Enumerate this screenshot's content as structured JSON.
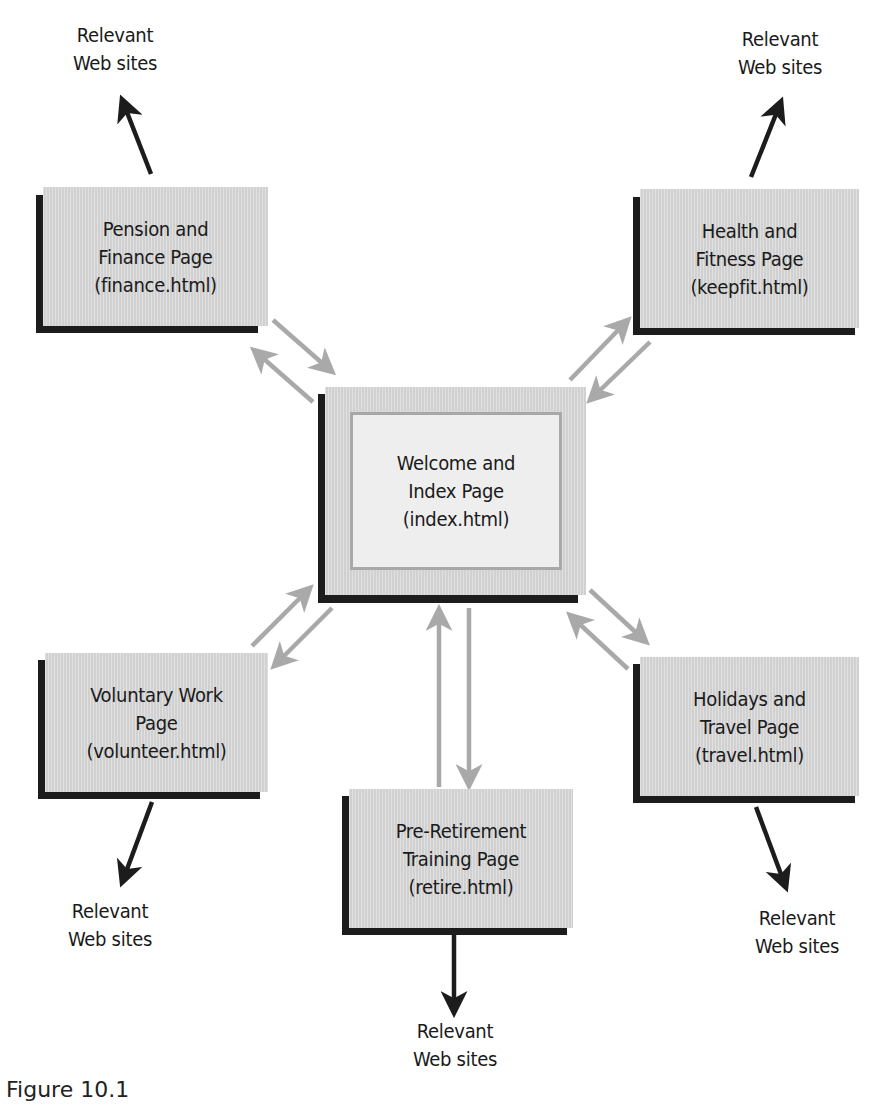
{
  "diagram": {
    "type": "site-map",
    "caption": "Figure 10.1",
    "colors": {
      "box_fill": "#d9d9d9",
      "box_shadow": "#1c1c1c",
      "hub_inner_fill": "#eeeeee",
      "hub_inner_border": "#a8a8a8",
      "internal_arrow": "#a9a9a9",
      "external_arrow": "#1c1c1c"
    },
    "hub": {
      "id": "index",
      "label": "Welcome and\nIndex Page\n(index.html)"
    },
    "pages": [
      {
        "id": "finance",
        "label": "Pension and\nFinance Page\n(finance.html)"
      },
      {
        "id": "keepfit",
        "label": "Health and\nFitness Page\n(keepfit.html)"
      },
      {
        "id": "volunteer",
        "label": "Voluntary Work\nPage\n(volunteer.html)"
      },
      {
        "id": "retire",
        "label": "Pre-Retirement\nTraining Page\n(retire.html)"
      },
      {
        "id": "travel",
        "label": "Holidays and\nTravel Page\n(travel.html)"
      }
    ],
    "external_label": "Relevant\nWeb sites",
    "edges": [
      {
        "from": "index",
        "to": "finance",
        "style": "bidirectional-gray"
      },
      {
        "from": "index",
        "to": "keepfit",
        "style": "bidirectional-gray"
      },
      {
        "from": "index",
        "to": "volunteer",
        "style": "bidirectional-gray"
      },
      {
        "from": "index",
        "to": "retire",
        "style": "bidirectional-gray"
      },
      {
        "from": "index",
        "to": "travel",
        "style": "bidirectional-gray"
      },
      {
        "from": "finance",
        "to": "external",
        "style": "black"
      },
      {
        "from": "keepfit",
        "to": "external",
        "style": "black"
      },
      {
        "from": "volunteer",
        "to": "external",
        "style": "black"
      },
      {
        "from": "retire",
        "to": "external",
        "style": "black"
      },
      {
        "from": "travel",
        "to": "external",
        "style": "black"
      }
    ]
  },
  "externals": [
    {
      "id": "ext-finance",
      "label": "Relevant\nWeb sites"
    },
    {
      "id": "ext-keepfit",
      "label": "Relevant\nWeb sites"
    },
    {
      "id": "ext-volunteer",
      "label": "Relevant\nWeb sites"
    },
    {
      "id": "ext-retire",
      "label": "Relevant\nWeb sites"
    },
    {
      "id": "ext-travel",
      "label": "Relevant\nWeb sites"
    }
  ]
}
